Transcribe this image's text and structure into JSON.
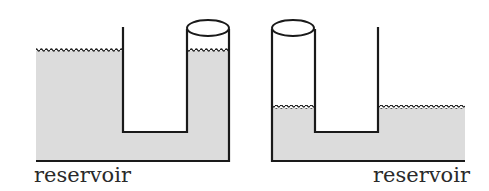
{
  "figure": {
    "left_panel": {
      "label": "reservoir",
      "description": "reservoir connected to tube; liquid level in tube equal to reservoir level"
    },
    "right_panel": {
      "label": "reservoir",
      "description": "tube connected to reservoir; liquid level in tube equal to reservoir level"
    }
  },
  "colors": {
    "liquid": "#dcdcdc",
    "stroke": "#1a1a1a",
    "background": "#ffffff"
  }
}
